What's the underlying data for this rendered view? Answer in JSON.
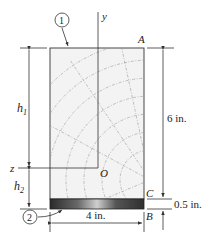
{
  "figure": {
    "type": "composite beam cross-section",
    "materials": [
      {
        "id": "1",
        "label": "①",
        "name": "wood"
      },
      {
        "id": "2",
        "label": "②",
        "name": "steel plate"
      }
    ],
    "axes": {
      "y": "y",
      "z": "z",
      "origin": "O"
    },
    "points": {
      "A": "A",
      "B": "B",
      "C": "C"
    },
    "dimensions": {
      "h1": "h",
      "h1_sub": "1",
      "h2": "h",
      "h2_sub": "2",
      "total_height": "6 in.",
      "plate_thickness": "0.5 in.",
      "width": "4 in."
    }
  },
  "colors": {
    "wood_fill": "#f2f2f2",
    "steel_dark": "#3a3a3a",
    "line": "#333333"
  }
}
